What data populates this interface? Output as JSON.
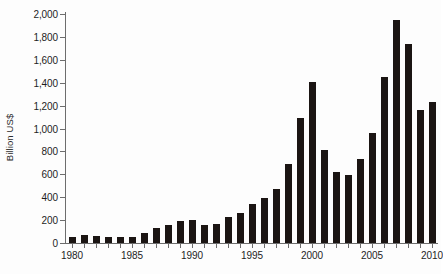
{
  "chart_data": {
    "type": "bar",
    "title": "",
    "xlabel": "",
    "ylabel": "Billion US$",
    "ylim": [
      0,
      2000
    ],
    "ytick_values": [
      0,
      200,
      400,
      600,
      800,
      1000,
      1200,
      1400,
      1600,
      1800,
      2000
    ],
    "ytick_labels": [
      "0",
      "200",
      "400",
      "600",
      "800",
      "1,000",
      "1,200",
      "1,400",
      "1,600",
      "1,800",
      "2,000"
    ],
    "xtick_labels": [
      "1980",
      "1985",
      "1990",
      "1995",
      "2000",
      "2005",
      "2010"
    ],
    "xtick_categories": [
      "1980",
      "1985",
      "1990",
      "1995",
      "2000",
      "2005",
      "2010"
    ],
    "grid": false,
    "legend": false,
    "bar_color": "#1b1513",
    "axis_color": "#6d6d6d",
    "categories": [
      "1980",
      "1981",
      "1982",
      "1983",
      "1984",
      "1985",
      "1986",
      "1987",
      "1988",
      "1989",
      "1990",
      "1991",
      "1992",
      "1993",
      "1994",
      "1995",
      "1996",
      "1997",
      "1998",
      "1999",
      "2000",
      "2001",
      "2002",
      "2003",
      "2004",
      "2005",
      "2006",
      "2007",
      "2008",
      "2009",
      "2010"
    ],
    "values": [
      55,
      70,
      58,
      50,
      55,
      55,
      90,
      135,
      160,
      190,
      205,
      155,
      165,
      225,
      260,
      340,
      390,
      475,
      690,
      1090,
      1410,
      810,
      620,
      595,
      730,
      960,
      1450,
      1950,
      1740,
      1160,
      1230
    ]
  },
  "y_axis": {
    "title": "Billion US$"
  }
}
